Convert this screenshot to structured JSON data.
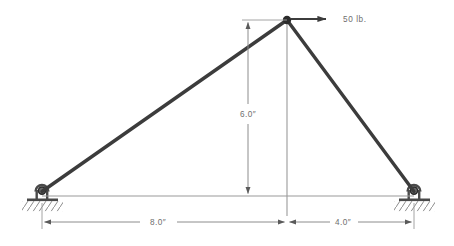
{
  "diagram": {
    "type": "statics-free-body-diagram",
    "background_color": "#ffffff",
    "member_color": "#3c3c3c",
    "thin_line_color": "#8c8c8c",
    "text_color": "#6e6e6e",
    "node_color": "#2b2b2b",
    "geometry": {
      "apex": {
        "x": 287,
        "y": 20
      },
      "left_support": {
        "x": 42,
        "y": 196
      },
      "right_support": {
        "x": 414,
        "y": 196
      },
      "apex_ground_point": {
        "x": 287,
        "y": 196
      }
    },
    "load": {
      "label": "50 lb.",
      "magnitude": 50,
      "unit": "lb.",
      "direction": "right",
      "applied_at": "apex",
      "arrow_start_x": 291,
      "arrow_end_x": 334,
      "arrow_y": 19,
      "label_x": 343,
      "label_y": 22
    },
    "dimensions": [
      {
        "name": "height",
        "label": "6.0″",
        "value": 6.0,
        "unit": "in",
        "orientation": "vertical",
        "from": "apex",
        "to": "bottom chord",
        "line_x": 248,
        "top_y": 20,
        "bottom_y": 196,
        "label_x": 248,
        "label_y": 114
      },
      {
        "name": "left-span",
        "label": "8.0″",
        "value": 8.0,
        "unit": "in",
        "orientation": "horizontal",
        "from": "left support",
        "to": "apex centerline",
        "line_y": 222,
        "left_x": 42,
        "right_x": 287,
        "label_x": 158,
        "label_y": 225
      },
      {
        "name": "right-span",
        "label": "4.0″",
        "value": 4.0,
        "unit": "in",
        "orientation": "horizontal",
        "from": "apex centerline",
        "to": "right support",
        "line_y": 222,
        "left_x": 287,
        "right_x": 414,
        "label_x": 343,
        "label_y": 225
      }
    ],
    "members": [
      {
        "name": "left-member",
        "from": "left_support",
        "to": "apex"
      },
      {
        "name": "right-member",
        "from": "apex",
        "to": "right_support"
      }
    ],
    "supports": [
      {
        "name": "left-pin-support",
        "type": "pin",
        "x": 42,
        "y": 196
      },
      {
        "name": "right-pin-support",
        "type": "pin",
        "x": 414,
        "y": 196
      }
    ],
    "nodes": [
      {
        "name": "apex-node",
        "x": 287,
        "y": 20,
        "radius": 4.2
      }
    ]
  }
}
